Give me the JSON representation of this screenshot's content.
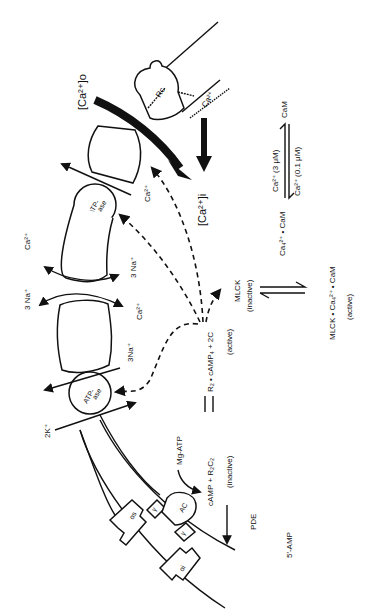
{
  "diagram": {
    "orientation": "rotated-90-ccw",
    "extracellular_calcium": "[Ca²⁺]o",
    "intracellular_calcium": "[Ca²⁺]i",
    "receptor_label": "Rc",
    "receptor_channel_ion": "Ca²⁺",
    "pumps": [
      {
        "label_line1": "ATP-",
        "label_line2": "ase",
        "ion_out": "Ca²⁺"
      },
      {
        "label_line1": "ATP-",
        "label_line2": "ase",
        "ion_in": "2K⁺",
        "ion_out": "3Na⁺"
      }
    ],
    "exchanger": {
      "ion_a_left": "3 Na⁺",
      "ion_a_right": "Ca²⁺",
      "ion_b_left": "Ca²⁺",
      "ion_b_right": "3 Na⁺"
    },
    "g_proteins": {
      "stimulatory": "αs",
      "inhibitory": "αi",
      "gamma_top": "γ",
      "gamma_bottom": "γ",
      "cyclase": "AC"
    },
    "reactions": {
      "mg_atp": "Mg-ATP",
      "camp_eq_left": "cAMP + R₂C₂",
      "camp_eq_right": "R₂ • cAMP₄ + 2C",
      "inactive_label": "(inactive)",
      "active_label": "(active)",
      "pde": "PDE",
      "product": "5′-AMP",
      "mlck": "MLCK",
      "mlck_inactive": "(inactive)",
      "mlck_complex": "MLCK • Ca₄²⁺ • CaM",
      "mlck_complex_state": "(active)",
      "ca_cam_complex": "Ca₄²⁺ • CaM",
      "forward_condition": "Ca²⁺ (3 μM)",
      "reverse_condition": "Ca²⁺ (0.1 μM)",
      "cam": "CaM"
    }
  }
}
